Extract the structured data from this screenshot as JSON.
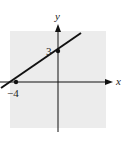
{
  "figure": {
    "axes": {
      "x_label": "x",
      "y_label": "y"
    },
    "points": [
      {
        "label": "3",
        "x": 0,
        "y": 3
      },
      {
        "label": "−4",
        "x": -4,
        "y": 0
      }
    ],
    "line": {
      "slope": 0.75,
      "intercept": 3,
      "equation_form": "through (-4,0) and (0,3)"
    },
    "colors": {
      "background": "#ffffff",
      "plot_area": "#ececec",
      "ink": "#111111"
    }
  }
}
